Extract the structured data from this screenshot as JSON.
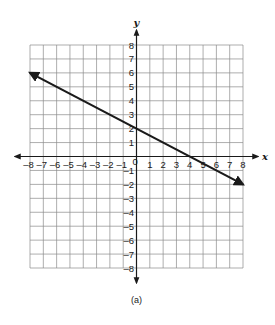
{
  "caption": "(a)",
  "colors": {
    "grid": "#8a8a8a",
    "axis": "#1a1a1a",
    "line": "#1a1a1a",
    "background": "#ffffff"
  },
  "chart_data": {
    "type": "line",
    "title": "",
    "caption": "(a)",
    "xlabel": "x",
    "ylabel": "y",
    "xlim": [
      -8,
      8
    ],
    "ylim": [
      -8,
      8
    ],
    "grid": true,
    "x_ticks": [
      -8,
      -7,
      -6,
      -5,
      -4,
      -3,
      -2,
      -1,
      1,
      2,
      3,
      4,
      5,
      6,
      7,
      8
    ],
    "y_ticks": [
      -8,
      -7,
      -6,
      -5,
      -4,
      -3,
      -2,
      -1,
      1,
      2,
      3,
      4,
      5,
      6,
      7,
      8
    ],
    "origin_label": "0",
    "series": [
      {
        "name": "line",
        "equation": "y = -0.5x + 2",
        "slope": -0.5,
        "y_intercept": 2,
        "x_intercept": 4,
        "x": [
          -8,
          8
        ],
        "y": [
          6,
          -2
        ],
        "arrows_both_ends": true
      }
    ]
  },
  "layout": {
    "plot_left": 30,
    "plot_right": 243,
    "plot_top": 45,
    "plot_bottom": 268,
    "x_axis_extent": [
      15,
      258
    ],
    "y_axis_extent": [
      30,
      283
    ]
  }
}
